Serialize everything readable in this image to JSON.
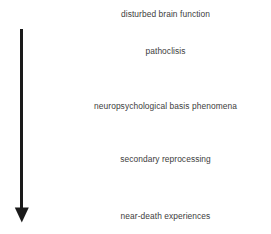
{
  "figure": {
    "type": "flow-sequence-diagram",
    "background_color": "#ffffff",
    "width": 271,
    "height": 234,
    "arrow": {
      "name": "downward-progression-arrow",
      "direction": "down",
      "color": "#1a1a1a",
      "shaft_x": 21.5,
      "shaft_top_y": 29,
      "shaft_bottom_y": 209,
      "shaft_width": 3,
      "head_width": 14,
      "head_height": 14,
      "tip_y": 222
    },
    "stages": [
      {
        "label": "disturbed brain function"
      },
      {
        "label": "pathoclisis"
      },
      {
        "label": "neuropsychological basis phenomena"
      },
      {
        "label": "secondary reprocessing"
      },
      {
        "label": "near-death experiences"
      }
    ],
    "text_color": "#3d3d3d"
  }
}
